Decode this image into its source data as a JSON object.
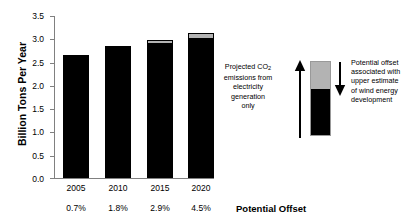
{
  "chart_data": {
    "type": "bar",
    "title": "",
    "subtitle": "",
    "xlabel": "Potential Offset",
    "ylabel": "Billion Tons Per Year",
    "ylim": [
      0.0,
      3.5
    ],
    "ytick_values": [
      0.0,
      0.5,
      1.0,
      1.5,
      2.0,
      2.5,
      3.0,
      3.5
    ],
    "ytick_labels": [
      "0.0",
      "0.5",
      "1.0",
      "1.5",
      "2.0",
      "2.5",
      "3.0",
      "3.5"
    ],
    "grid": false,
    "legend_position": "right",
    "categories": [
      "2005",
      "2010",
      "2015",
      "2020"
    ],
    "secondary_category_labels": [
      "0.7%",
      "1.8%",
      "2.9%",
      "4.5%"
    ],
    "stacked": true,
    "series": [
      {
        "name": "Projected CO2 emissions from electricity generation only",
        "color": "#000000",
        "values": [
          2.61,
          2.81,
          2.89,
          3.0
        ]
      },
      {
        "name": "Potential offset associated with upper estimate of wind energy development",
        "color": "#b3b3b3",
        "values": [
          0.04,
          0.05,
          0.09,
          0.14
        ]
      }
    ],
    "totals": [
      2.65,
      2.86,
      2.98,
      3.14
    ],
    "annotations": [
      "Projected CO2 emissions from electricity generation only",
      "Potential offset associated with upper estimate of wind energy development"
    ]
  },
  "axes": {
    "y_title": "Billion Tons Per Year",
    "x_title": "Potential Offset",
    "y_ticks": [
      "3.5",
      "3.0",
      "2.5",
      "2.0",
      "1.5",
      "1.0",
      "0.5",
      "0.0"
    ],
    "x_categories": [
      "2005",
      "2010",
      "2015",
      "2020"
    ],
    "x_percentages": [
      "0.7%",
      "1.8%",
      "2.9%",
      "4.5%"
    ]
  },
  "annotations": {
    "emissions_line1": "Projected CO",
    "emissions_sub": "2",
    "emissions_line2": "emissions from",
    "emissions_line3": "electricity",
    "emissions_line4": "generation",
    "emissions_line5": "only",
    "offset_line1": "Potential offset",
    "offset_line2": "associated with",
    "offset_line3": "upper estimate",
    "offset_line4": "of wind energy",
    "offset_line5": "development"
  },
  "colors": {
    "emissions": "#000000",
    "offset": "#b3b3b3",
    "axis": "#808080",
    "background": "#ffffff"
  }
}
